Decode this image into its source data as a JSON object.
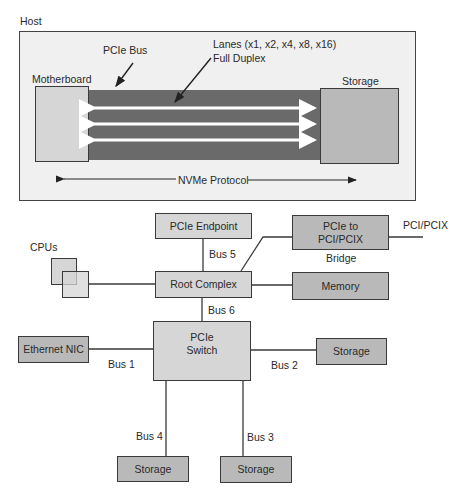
{
  "top_panel": {
    "host_label": "Host",
    "pcie_bus_label": "PCIe Bus",
    "lanes_label_line1": "Lanes (x1, x2, x4, x8, x16)",
    "lanes_label_line2": "Full Duplex",
    "motherboard_label": "Motherboard",
    "storage_label": "Storage",
    "protocol_label": "NVMe Protocol",
    "lane_count_shown": 3
  },
  "bottom_panel": {
    "cpus_label": "CPUs",
    "pcie_endpoint": "PCIe Endpoint",
    "bridge_line1": "PCIe to",
    "bridge_line2": "PCI/PCIX",
    "bridge_caption": "Bridge",
    "pci_pcix_label": "PCI/PCIX",
    "root_complex": "Root Complex",
    "memory": "Memory",
    "switch_line1": "PCIe",
    "switch_line2": "Switch",
    "ethernet_nic": "Ethernet NIC",
    "storage_right": "Storage",
    "storage_bottom_left": "Storage",
    "storage_bottom_right": "Storage",
    "buses": {
      "bus1": "Bus 1",
      "bus2": "Bus 2",
      "bus3": "Bus 3",
      "bus4": "Bus 4",
      "bus5": "Bus 5",
      "bus6": "Bus 6"
    }
  },
  "colors": {
    "host_bg": "#f0f0f0",
    "bus_band": "#6a6a6a",
    "box_light": "#d6d6d6",
    "box_mid": "#b9b9b9",
    "line": "#3a3a3a"
  }
}
